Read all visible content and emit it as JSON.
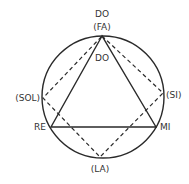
{
  "diagram": {
    "type": "circle-of-notes",
    "labels": {
      "top_main": "DO",
      "top_alt": "(FA)",
      "inner_top": "DO",
      "left_alt": "(SOL)",
      "right_alt": "(SI)",
      "left_main": "RE",
      "right_main": "MI",
      "bottom_alt": "(LA)"
    },
    "solid_triangle": [
      "DO",
      "RE",
      "MI"
    ],
    "dashed_quadrilateral": [
      "(FA)",
      "(SI)",
      "(LA)",
      "(SOL)"
    ],
    "colors": {
      "stroke": "#2a2a2a",
      "text": "#333333",
      "background": "#ffffff"
    }
  }
}
